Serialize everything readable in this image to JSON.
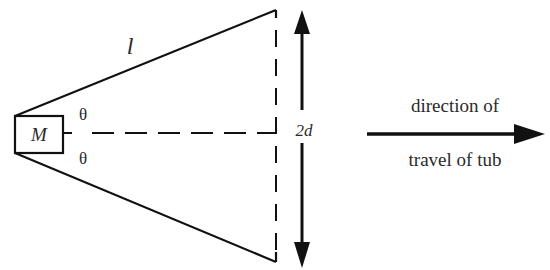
{
  "diagram": {
    "mass_label": "M",
    "length_label": "l",
    "angle_top_label": "θ",
    "angle_bottom_label": "θ",
    "separation_label": "2d",
    "direction_label_line1": "direction of",
    "direction_label_line2": "travel of tub",
    "colors": {
      "stroke": "#111111",
      "text": "#2a2a2a",
      "background": "#ffffff"
    }
  }
}
